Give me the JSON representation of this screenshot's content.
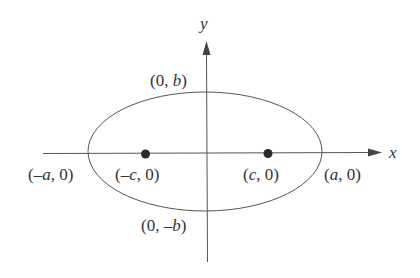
{
  "diagram": {
    "type": "ellipse-with-foci",
    "colors": {
      "stroke": "#555555",
      "text": "#333333",
      "focus": "#2a2a2a",
      "background": "#ffffff"
    },
    "axes": {
      "x_label": "x",
      "y_label": "y"
    },
    "ellipse": {
      "cx": 205,
      "cy": 152,
      "rx": 117,
      "ry": 59
    },
    "foci": [
      {
        "name": "left-focus",
        "cx": 146,
        "cy": 153
      },
      {
        "name": "right-focus",
        "cx": 268,
        "cy": 153
      }
    ],
    "labels": {
      "top_vertex": {
        "open": "(0, ",
        "var": "b",
        "close": ")"
      },
      "bottom_vertex": {
        "open": "(0, –",
        "var": "b",
        "close": ")"
      },
      "left_vertex": {
        "open": "(–",
        "var": "a",
        "close": ", 0)"
      },
      "right_vertex": {
        "open": "(",
        "var": "a",
        "close": ", 0)"
      },
      "left_focus": {
        "open": "(–",
        "var": "c",
        "close": ", 0)"
      },
      "right_focus": {
        "open": "(",
        "var": "c",
        "close": ", 0)"
      }
    }
  }
}
